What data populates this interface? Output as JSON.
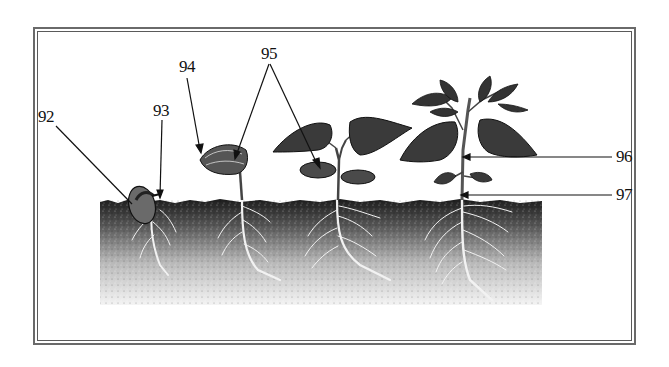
{
  "figure": {
    "labels": [
      {
        "id": "92",
        "text": "92",
        "x": 38,
        "y": 108
      },
      {
        "id": "93",
        "text": "93",
        "x": 153,
        "y": 102
      },
      {
        "id": "94",
        "text": "94",
        "x": 179,
        "y": 58
      },
      {
        "id": "95",
        "text": "95",
        "x": 261,
        "y": 45
      },
      {
        "id": "96",
        "text": "96",
        "x": 616,
        "y": 148
      },
      {
        "id": "97",
        "text": "97",
        "x": 616,
        "y": 186
      }
    ],
    "stages": [
      {
        "name": "germinating-seed",
        "x": 140
      },
      {
        "name": "emerging-hypocotyl-hook",
        "x": 240
      },
      {
        "name": "seedling-with-cotyledons",
        "x": 340
      },
      {
        "name": "mature-seedling",
        "x": 462
      }
    ],
    "colors": {
      "ink": "#111111",
      "frame": "#5a5a5a",
      "soil_dark": "#1c1c1c",
      "soil_light": "#f4f4f4",
      "leaf": "#3a3a3a",
      "background": "#ffffff"
    }
  }
}
